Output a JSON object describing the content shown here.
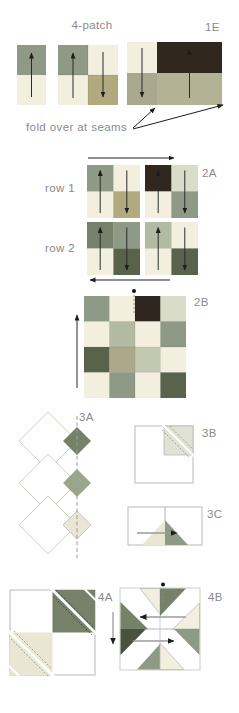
{
  "palette": {
    "cream": "#f2efdf",
    "cream_dark": "#e9e6d3",
    "light_sage": "#d9dcc8",
    "sage": "#b2baa1",
    "pale_green": "#c3c9b0",
    "gray_green": "#8e9a85",
    "khaki": "#b1aa7e",
    "khaki_gray": "#aca88a",
    "tan": "#b4b295",
    "gray_tan": "#a9a78e",
    "dark_sage": "#76816a",
    "dark_olive": "#59634c",
    "darkest_olive": "#49523f",
    "dark_brown": "#30271f",
    "label_gray": "#8a8a8a",
    "outline_gray": "#b9b9b9",
    "light_outline": "#cfcfc4",
    "arrow_black": "#1d1d1d",
    "arrow_gray": "#9a9a9a",
    "stitch_gray": "#8a8a8a",
    "white": "#ffffff"
  },
  "labels": {
    "title": "4-patch",
    "fold_note": "fold over at seams",
    "row1": "row 1",
    "row2": "row 2",
    "s1e": "1E",
    "s2a": "2A",
    "s2b": "2B",
    "s3a": "3A",
    "s3b": "3B",
    "s3c": "3C",
    "s4a": "4A",
    "s4b": "4B"
  },
  "d1_pair": {
    "top": "#8e9a85",
    "bottom": "#f2efdf"
  },
  "d2_fourpatch": {
    "tl": "#8e9a85",
    "tr": "#f2efdf",
    "bl": "#f2efdf",
    "br": "#b1aa7e"
  },
  "d3_1e": {
    "left_top": "#f2efdf",
    "left_bottom": "#a9a78e",
    "right_top": "#30271f",
    "right_bottom": "#b4b295"
  },
  "blocks_2a": {
    "r1b1": {
      "tl": "#8e9a85",
      "tr": "#f2efdf",
      "bl": "#f2efdf",
      "br": "#b1aa7e"
    },
    "r1b2": {
      "tl": "#30271f",
      "tr": "#d9dcc8",
      "bl": "#f2efdf",
      "br": "#8e9a85"
    },
    "r2b1": {
      "tl": "#76816a",
      "tr": "#8e9a85",
      "bl": "#f2efdf",
      "br": "#59634c"
    },
    "r2b2": {
      "tl": "#b2baa1",
      "tr": "#f2efdf",
      "bl": "#f2efdf",
      "br": "#59634c"
    }
  },
  "grid_2b": {
    "rows": [
      [
        "#8e9a85",
        "#f2efdf",
        "#2f261f",
        "#d9dcc8"
      ],
      [
        "#f2efdf",
        "#b2baa1",
        "#f2efdf",
        "#8e9a85"
      ],
      [
        "#59634c",
        "#aca88a",
        "#c3c9b0",
        "#f2efdf"
      ],
      [
        "#f2efdf",
        "#8e9a85",
        "#f2efdf",
        "#59634c"
      ]
    ]
  },
  "diamonds_3a": {
    "d1": "#76816a",
    "d2": "#9aa58c",
    "d3": "#e9e6d3"
  },
  "sq_3b": {
    "patch": "#e0e2d3"
  },
  "tri_3c": {
    "left": "#e9e6d3",
    "right": "#8e9a85"
  },
  "sq_4a": {
    "tr": "#76816a",
    "bl": "#e9e6d3"
  },
  "tri_4b": {
    "top_left": "#f2efdf",
    "top_right": "#76816a",
    "left_upper": "#76816a",
    "left_lower": "#49523f",
    "right_upper": "#f2efdf",
    "right_lower": "#8e9a85",
    "bottom_left": "#8e9a85",
    "bottom_right": "#f2efdf"
  }
}
